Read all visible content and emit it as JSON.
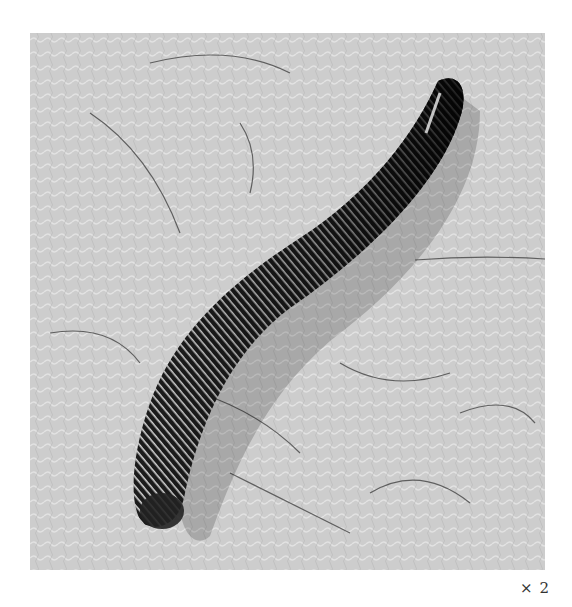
{
  "figure": {
    "magnification_label": "× 2",
    "colors": {
      "background": "#ffffff",
      "skin": "#cfcfcf",
      "leech_body": "#1a1a1a",
      "leech_bands": "#e8e8e8",
      "hair": "#3a3a3a"
    }
  }
}
